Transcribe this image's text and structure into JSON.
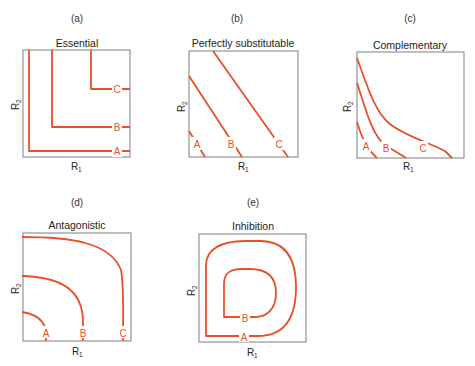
{
  "colors": {
    "curve": "#e8502a",
    "frame": "#8a8a8a",
    "text": "#222222"
  },
  "panels": [
    {
      "letter": "(a)",
      "title": "Essential",
      "xlabel": "R",
      "xsub": "1",
      "ylabel": "R",
      "ysub": "2",
      "curves": [
        "A",
        "B",
        "C"
      ]
    },
    {
      "letter": "(b)",
      "title": "Perfectly substitutable",
      "xlabel": "R",
      "xsub": "1",
      "ylabel": "R",
      "ysub": "2",
      "curves": [
        "A",
        "B",
        "C"
      ]
    },
    {
      "letter": "(c)",
      "title": "Complementary",
      "xlabel": "R",
      "xsub": "1",
      "ylabel": "R",
      "ysub": "2",
      "curves": [
        "A",
        "B",
        "C"
      ]
    },
    {
      "letter": "(d)",
      "title": "Antagonistic",
      "xlabel": "R",
      "xsub": "1",
      "ylabel": "R",
      "ysub": "2",
      "curves": [
        "A",
        "B",
        "C"
      ]
    },
    {
      "letter": "(e)",
      "title": "Inhibition",
      "xlabel": "R",
      "xsub": "1",
      "ylabel": "R",
      "ysub": "2",
      "curves": [
        "A",
        "B"
      ]
    }
  ]
}
